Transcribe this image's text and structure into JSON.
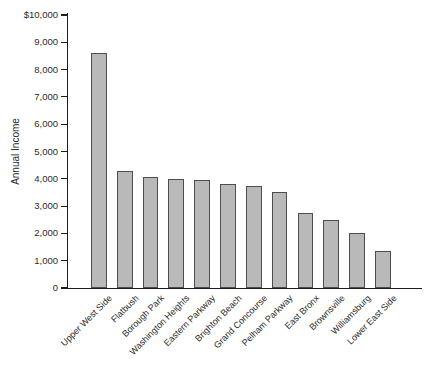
{
  "figure": {
    "background": "#ffffff"
  },
  "chart_data": {
    "type": "bar",
    "title": "",
    "xlabel": "",
    "ylabel": "Annual Income",
    "categories": [
      "Upper West Side",
      "Flatbush",
      "Borough Park",
      "Washington Heights",
      "Eastern Parkway",
      "Brighton Beach",
      "Grand Concourse",
      "Pelham Parkway",
      "East Bronx",
      "Brownsville",
      "Williamsburg",
      "Lower East Side"
    ],
    "values": [
      8600,
      4300,
      4050,
      4000,
      3950,
      3800,
      3750,
      3500,
      2750,
      2500,
      2000,
      1350
    ],
    "ylim": [
      0,
      10000
    ],
    "y_ticks": [
      0,
      1000,
      2000,
      3000,
      4000,
      5000,
      6000,
      7000,
      8000,
      9000,
      10000
    ],
    "y_tick_labels": [
      "0",
      "1,000",
      "2,000",
      "3,000",
      "4,000",
      "5,000",
      "6,000",
      "7,000",
      "8,000",
      "9,000",
      "$10,000"
    ],
    "grid": false,
    "legend_position": "none",
    "colors": {
      "bar_fill": "#b9b9b9",
      "bar_border": "#4d4d4d",
      "axis": "#1c1c1c",
      "text": "#2a2a2a"
    }
  }
}
